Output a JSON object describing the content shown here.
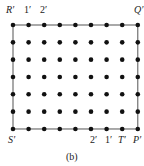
{
  "figure": {
    "caption": "(b)",
    "grid": {
      "columns": 9,
      "rows": 7,
      "x0": 13,
      "dx": 15.6,
      "y0": 25,
      "dy": 17.33,
      "dot_radius": 2.3,
      "dot_color": "#111111",
      "line_color": "#555555"
    },
    "labels": {
      "top_left": "R′",
      "top_1": "1′",
      "top_2": "2′",
      "top_right": "Q′",
      "bottom_left": "S′",
      "bottom_2": "2′",
      "bottom_1": "1′",
      "bottom_T": "T′",
      "bottom_right": "P′"
    }
  }
}
